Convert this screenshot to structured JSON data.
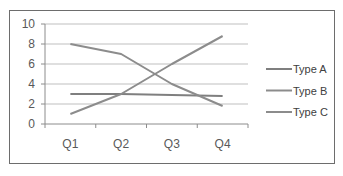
{
  "chart_data": {
    "type": "line",
    "title": "",
    "xlabel": "",
    "ylabel": "",
    "categories": [
      "Q1",
      "Q2",
      "Q3",
      "Q4"
    ],
    "series": [
      {
        "name": "Type A",
        "values": [
          3,
          3,
          2.9,
          2.8
        ],
        "color": "#7f7f7f"
      },
      {
        "name": "Type B",
        "values": [
          8,
          7,
          4,
          1.8
        ],
        "color": "#8c8c8c"
      },
      {
        "name": "Type C",
        "values": [
          1,
          3,
          6,
          8.8
        ],
        "color": "#8c8c8c"
      }
    ],
    "ylim": [
      0,
      10
    ],
    "yticks": [
      "0",
      "2",
      "4",
      "6",
      "8",
      "10"
    ],
    "grid": true,
    "legend_position": "right"
  }
}
